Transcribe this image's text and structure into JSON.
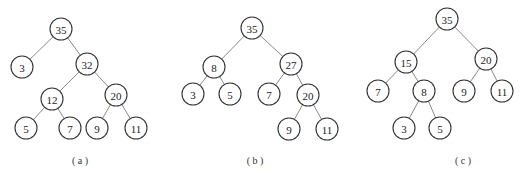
{
  "trees": [
    {
      "caption": "( a )",
      "caption_pos": [
        80,
        164
      ],
      "nodes": [
        {
          "id": "a35",
          "label": "35",
          "x": 61,
          "y": 29
        },
        {
          "id": "a3",
          "label": "3",
          "x": 22,
          "y": 67
        },
        {
          "id": "a32",
          "label": "32",
          "x": 87,
          "y": 64
        },
        {
          "id": "a12",
          "label": "12",
          "x": 52,
          "y": 99
        },
        {
          "id": "a20",
          "label": "20",
          "x": 116,
          "y": 95
        },
        {
          "id": "a5",
          "label": "5",
          "x": 26,
          "y": 128
        },
        {
          "id": "a7",
          "label": "7",
          "x": 70,
          "y": 128
        },
        {
          "id": "a9",
          "label": "9",
          "x": 97,
          "y": 128
        },
        {
          "id": "a11",
          "label": "11",
          "x": 136,
          "y": 128
        }
      ],
      "edges": [
        [
          "a35",
          "a3"
        ],
        [
          "a35",
          "a32"
        ],
        [
          "a32",
          "a12"
        ],
        [
          "a32",
          "a20"
        ],
        [
          "a12",
          "a5"
        ],
        [
          "a12",
          "a7"
        ],
        [
          "a20",
          "a9"
        ],
        [
          "a20",
          "a11"
        ]
      ]
    },
    {
      "caption": "( b )",
      "caption_pos": [
        255,
        164
      ],
      "nodes": [
        {
          "id": "b35",
          "label": "35",
          "x": 252,
          "y": 28
        },
        {
          "id": "b8",
          "label": "8",
          "x": 214,
          "y": 67
        },
        {
          "id": "b27",
          "label": "27",
          "x": 291,
          "y": 64
        },
        {
          "id": "b3",
          "label": "3",
          "x": 193,
          "y": 94
        },
        {
          "id": "b5",
          "label": "5",
          "x": 230,
          "y": 94
        },
        {
          "id": "b7",
          "label": "7",
          "x": 269,
          "y": 94
        },
        {
          "id": "b20",
          "label": "20",
          "x": 308,
          "y": 95
        },
        {
          "id": "b9",
          "label": "9",
          "x": 289,
          "y": 129
        },
        {
          "id": "b11",
          "label": "11",
          "x": 327,
          "y": 129
        }
      ],
      "edges": [
        [
          "b35",
          "b8"
        ],
        [
          "b35",
          "b27"
        ],
        [
          "b8",
          "b3"
        ],
        [
          "b8",
          "b5"
        ],
        [
          "b27",
          "b7"
        ],
        [
          "b27",
          "b20"
        ],
        [
          "b20",
          "b9"
        ],
        [
          "b20",
          "b11"
        ]
      ]
    },
    {
      "caption": "( c )",
      "caption_pos": [
        463,
        164
      ],
      "nodes": [
        {
          "id": "c35",
          "label": "35",
          "x": 447,
          "y": 19
        },
        {
          "id": "c15",
          "label": "15",
          "x": 406,
          "y": 62
        },
        {
          "id": "c20",
          "label": "20",
          "x": 486,
          "y": 59
        },
        {
          "id": "c7",
          "label": "7",
          "x": 378,
          "y": 91
        },
        {
          "id": "c8",
          "label": "8",
          "x": 424,
          "y": 91
        },
        {
          "id": "c9",
          "label": "9",
          "x": 464,
          "y": 91
        },
        {
          "id": "c11",
          "label": "11",
          "x": 502,
          "y": 91
        },
        {
          "id": "c3",
          "label": "3",
          "x": 404,
          "y": 128
        },
        {
          "id": "c5",
          "label": "5",
          "x": 440,
          "y": 128
        }
      ],
      "edges": [
        [
          "c35",
          "c15"
        ],
        [
          "c35",
          "c20"
        ],
        [
          "c15",
          "c7"
        ],
        [
          "c15",
          "c8"
        ],
        [
          "c20",
          "c9"
        ],
        [
          "c20",
          "c11"
        ],
        [
          "c8",
          "c3"
        ],
        [
          "c8",
          "c5"
        ]
      ]
    }
  ],
  "node_radius": 11
}
